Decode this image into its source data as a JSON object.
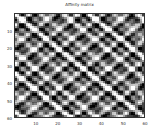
{
  "chart_data": {
    "type": "heatmap",
    "title": "Affinity matrix",
    "xlabel": "",
    "ylabel": "",
    "x_ticks": [
      10,
      20,
      30,
      40,
      50,
      60
    ],
    "y_ticks": [
      10,
      20,
      30,
      40,
      50,
      60
    ],
    "xlim": [
      0,
      60
    ],
    "ylim": [
      60,
      0
    ],
    "colormap": "gray",
    "grid": false,
    "size": [
      60,
      60
    ]
  }
}
